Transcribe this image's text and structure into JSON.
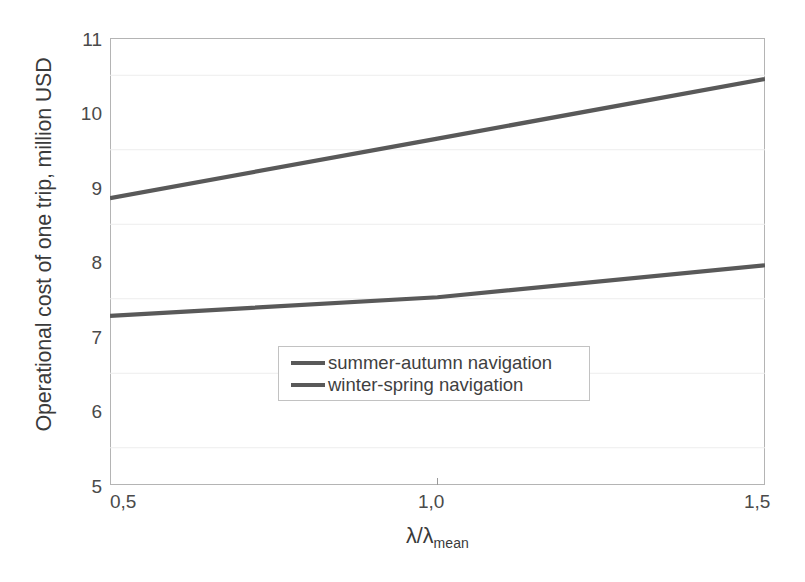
{
  "chart_data": {
    "type": "line",
    "title": "",
    "xlabel": "λ/λ",
    "xlabel_sub": "mean",
    "ylabel": "Operational cost of one trip, million USD",
    "xlim": [
      0.5,
      1.5
    ],
    "ylim": [
      5,
      11
    ],
    "x_ticks": [
      0.5,
      1.0,
      1.5
    ],
    "x_tick_labels": [
      "0,5",
      "1,0",
      "1,5"
    ],
    "y_ticks": [
      5,
      6,
      7,
      8,
      9,
      10,
      11
    ],
    "y_tick_labels": [
      "5",
      "6",
      "7",
      "8",
      "9",
      "10",
      "11"
    ],
    "grid": "horizontal-minor",
    "grid_minor_step": 0.5,
    "legend_position": "center",
    "x": [
      0.5,
      1.0,
      1.5
    ],
    "series": [
      {
        "name": "summer-autumn navigation",
        "values": [
          7.27,
          7.52,
          7.95
        ],
        "color": "#595959"
      },
      {
        "name": "winter-spring navigation",
        "values": [
          8.85,
          9.65,
          10.45
        ],
        "color": "#595959"
      }
    ]
  },
  "axes": {
    "y_title": "Operational cost of one trip, million USD",
    "x_title_main": "λ/λ",
    "x_title_sub": "mean",
    "y_tick_labels": [
      "11",
      "10",
      "9",
      "8",
      "7",
      "6",
      "5"
    ],
    "x_tick_labels": [
      "0,5",
      "1,0",
      "1,5"
    ]
  },
  "legend": {
    "items": [
      {
        "label": "summer-autumn navigation"
      },
      {
        "label": "winter-spring navigation"
      }
    ]
  },
  "colors": {
    "line": "#595959",
    "frame": "#b4b4b4",
    "grid": "#ededed",
    "text": "#3f3f3f",
    "background": "#ffffff"
  }
}
